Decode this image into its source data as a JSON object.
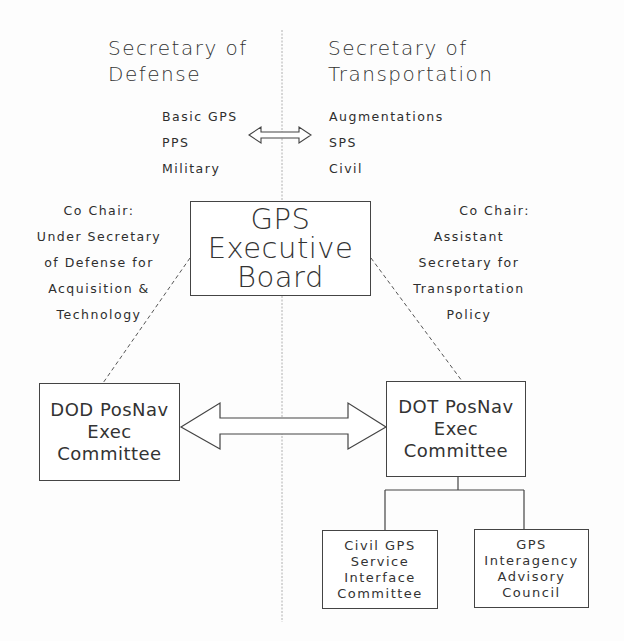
{
  "diagram": {
    "left_column": {
      "heading": [
        "Secretary of",
        "Defense"
      ],
      "services": [
        "Basic GPS",
        "PPS",
        "Military"
      ],
      "co_chair": [
        "Co Chair:",
        "Under Secretary",
        "of Defense  for",
        "Acquisition &",
        "Technology"
      ]
    },
    "right_column": {
      "heading": [
        "Secretary of",
        "Transportation"
      ],
      "services": [
        "Augmentations",
        "SPS",
        "Civil"
      ],
      "co_chair": [
        "Co Chair:",
        "Assistant",
        "Secretary for",
        "Transportation",
        "Policy"
      ]
    },
    "nodes": {
      "executive_board": [
        "GPS",
        "Executive",
        "Board"
      ],
      "dod_committee": [
        "DOD PosNav",
        "Exec",
        "Committee"
      ],
      "dot_committee": [
        "DOT PosNav",
        "Exec",
        "Committee"
      ],
      "civil_gps_committee": [
        "Civil GPS",
        "Service",
        "Interface",
        "Committee"
      ],
      "advisory_council": [
        "GPS",
        "Interagency",
        "Advisory",
        "Council"
      ]
    },
    "edges": [
      {
        "from": "left_column.services",
        "to": "right_column.services",
        "style": "double-arrow"
      },
      {
        "from": "executive_board",
        "to": "dod_committee",
        "style": "dashed"
      },
      {
        "from": "executive_board",
        "to": "dot_committee",
        "style": "dashed"
      },
      {
        "from": "dod_committee",
        "to": "dot_committee",
        "style": "double-arrow"
      },
      {
        "from": "dot_committee",
        "to": "civil_gps_committee",
        "style": "solid"
      },
      {
        "from": "dot_committee",
        "to": "advisory_council",
        "style": "solid"
      }
    ],
    "colors": {
      "line": "#444444",
      "background": "#fdfdfd",
      "divider": "#b0b0b0"
    }
  }
}
